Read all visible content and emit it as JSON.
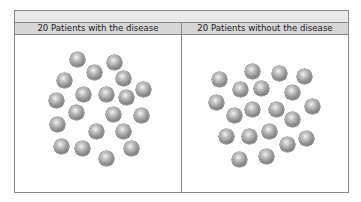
{
  "table": {
    "header_left": "20 Patients with the disease",
    "header_right": "20 Patients without the disease"
  },
  "colors": {
    "border": "#8a8a8a",
    "top_row_bg": "#e9e9e9",
    "header_bg": "#d6d6d6",
    "sphere": "#8c8c8c"
  },
  "groups": [
    {
      "name": "with-disease",
      "count": 20,
      "spheres": [
        [
          77,
          59
        ],
        [
          114,
          62
        ],
        [
          94,
          72
        ],
        [
          123,
          78
        ],
        [
          64,
          80
        ],
        [
          143,
          89
        ],
        [
          83,
          94
        ],
        [
          106,
          94
        ],
        [
          126,
          97
        ],
        [
          56,
          100
        ],
        [
          76,
          112
        ],
        [
          113,
          114
        ],
        [
          141,
          115
        ],
        [
          57,
          124
        ],
        [
          96,
          131
        ],
        [
          123,
          131
        ],
        [
          61,
          146
        ],
        [
          82,
          148
        ],
        [
          131,
          148
        ],
        [
          106,
          158
        ]
      ]
    },
    {
      "name": "without-disease",
      "count": 20,
      "spheres": [
        [
          219,
          79
        ],
        [
          252,
          71
        ],
        [
          279,
          73
        ],
        [
          304,
          76
        ],
        [
          240,
          89
        ],
        [
          261,
          88
        ],
        [
          292,
          92
        ],
        [
          216,
          102
        ],
        [
          312,
          106
        ],
        [
          234,
          115
        ],
        [
          252,
          109
        ],
        [
          276,
          109
        ],
        [
          292,
          119
        ],
        [
          226,
          136
        ],
        [
          249,
          136
        ],
        [
          269,
          131
        ],
        [
          306,
          138
        ],
        [
          287,
          144
        ],
        [
          239,
          159
        ],
        [
          266,
          156
        ]
      ]
    }
  ]
}
